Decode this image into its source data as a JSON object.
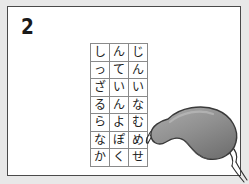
{
  "worksheet": {
    "question_number": "2",
    "background_color": "#e8e8e8",
    "panel_color": "#ffffff",
    "border_color": "#4a4a4a"
  },
  "kana_grid": {
    "columns": 3,
    "rows": 7,
    "cells": [
      [
        "し",
        "ん",
        "じ"
      ],
      [
        "っ",
        "て",
        "ん"
      ],
      [
        "ざ",
        "い",
        "い"
      ],
      [
        "る",
        "ん",
        "な"
      ],
      [
        "ら",
        "よ",
        "む"
      ],
      [
        "な",
        "ぽ",
        "め"
      ],
      [
        "か",
        "く",
        "せ"
      ]
    ],
    "border_color": "#8a8a8a",
    "text_color": "#222222"
  },
  "illustration": {
    "name": "sleep-mask",
    "label": "アイマスク",
    "body_fill": "#8c8c8c",
    "body_highlight": "#a6a6a6",
    "body_shadow": "#6e6e6e",
    "outline_color": "#3a3a3a",
    "strap_color": "#2e2e2e"
  }
}
